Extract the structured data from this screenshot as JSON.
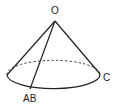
{
  "diagram": {
    "type": "cone",
    "labels": {
      "apex": "O",
      "generatrix_base": "AB",
      "right_point": "C"
    },
    "colors": {
      "stroke": "#222222",
      "background": "#ffffff"
    }
  }
}
